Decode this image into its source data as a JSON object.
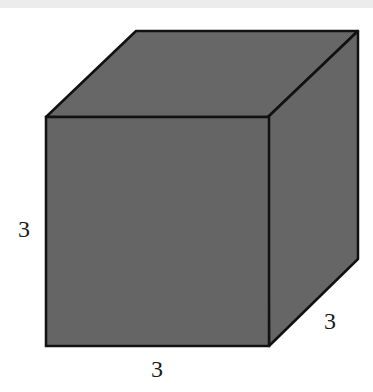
{
  "figure": {
    "type": "cube",
    "fill_color": "#666666",
    "stroke_color": "#111111",
    "labels": {
      "height": "3",
      "width": "3",
      "depth": "3"
    }
  }
}
